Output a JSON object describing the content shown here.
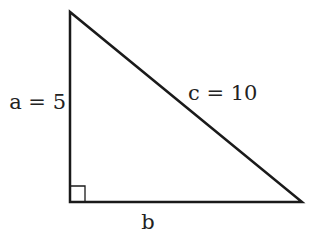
{
  "diagram": {
    "type": "right-triangle",
    "labels": {
      "a": "a = 5",
      "b": "b",
      "c": "c = 10"
    },
    "sides": {
      "a": 5,
      "c": 10
    },
    "right_angle_marker": true,
    "stroke_color": "#1a1a1a"
  }
}
